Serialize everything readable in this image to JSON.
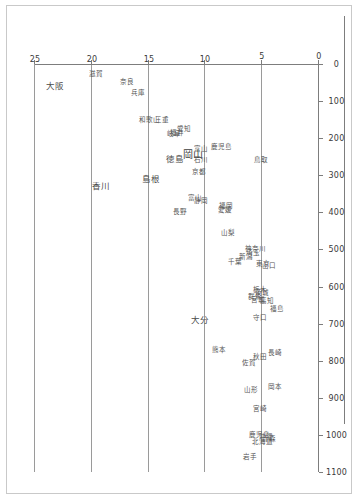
{
  "page": {
    "background_color": "#ffffff",
    "border_color": "#c9c9c9",
    "axis_color": "#7d7d7d",
    "grid_color": "#9a9a9a",
    "label_color": "#4a4a4a"
  },
  "chart_data": {
    "type": "scatter",
    "title": "",
    "subtitle": "",
    "xlabel": "",
    "ylabel": "",
    "orientation": "rotated-90-clockwise",
    "grid": true,
    "legend": "none",
    "xlim": [
      0,
      1100
    ],
    "ylim": [
      0,
      25
    ],
    "x_ticks": [
      0,
      100,
      200,
      300,
      400,
      500,
      600,
      700,
      800,
      900,
      1000,
      1100
    ],
    "x_tick_labels": [
      "0",
      "100",
      "200",
      "300",
      "400",
      "500",
      "600",
      "700",
      "800",
      "900",
      "1000",
      "1100"
    ],
    "y_ticks": [
      0,
      5,
      10,
      15,
      20,
      25
    ],
    "y_tick_labels": [
      "0",
      "5",
      "10",
      "15",
      "20",
      "25"
    ],
    "point_label_mode": "text-only",
    "points": [
      {
        "label": "大阪",
        "x": 60,
        "y": 23.2,
        "size": "mid"
      },
      {
        "label": "滋賀",
        "x": 28,
        "y": 19.6,
        "size": "sm"
      },
      {
        "label": "奈良",
        "x": 48,
        "y": 16.9,
        "size": "sm"
      },
      {
        "label": "兵庫",
        "x": 78,
        "y": 15.9,
        "size": "sm"
      },
      {
        "label": "三重",
        "x": 150,
        "y": 13.8,
        "size": "sm"
      },
      {
        "label": "和歌山",
        "x": 150,
        "y": 15.0,
        "size": "sm"
      },
      {
        "label": "愛知",
        "x": 175,
        "y": 11.9,
        "size": "sm"
      },
      {
        "label": "福井",
        "x": 185,
        "y": 12.5,
        "size": "sm"
      },
      {
        "label": "岐阜",
        "x": 190,
        "y": 12.8,
        "size": "sm"
      },
      {
        "label": "香川",
        "x": 330,
        "y": 19.2,
        "size": "mid"
      },
      {
        "label": "岡山",
        "x": 245,
        "y": 11.1,
        "size": "big"
      },
      {
        "label": "富山",
        "x": 228,
        "y": 10.4,
        "size": "sm"
      },
      {
        "label": "石川",
        "x": 258,
        "y": 10.4,
        "size": "sm"
      },
      {
        "label": "徳島",
        "x": 255,
        "y": 12.7,
        "size": "mid"
      },
      {
        "label": "島根",
        "x": 310,
        "y": 14.8,
        "size": "mid"
      },
      {
        "label": "京都",
        "x": 290,
        "y": 10.6,
        "size": "sm"
      },
      {
        "label": "鹿児島",
        "x": 225,
        "y": 8.6,
        "size": "sm"
      },
      {
        "label": "鳥取",
        "x": 260,
        "y": 5.1,
        "size": "sm"
      },
      {
        "label": "静岡",
        "x": 370,
        "y": 10.4,
        "size": "sm"
      },
      {
        "label": "富山",
        "x": 362,
        "y": 10.9,
        "size": "sm"
      },
      {
        "label": "福岡",
        "x": 383,
        "y": 8.2,
        "size": "sm"
      },
      {
        "label": "愛媛",
        "x": 393,
        "y": 8.3,
        "size": "sm"
      },
      {
        "label": "長野",
        "x": 400,
        "y": 12.2,
        "size": "sm"
      },
      {
        "label": "山梨",
        "x": 455,
        "y": 8.0,
        "size": "sm"
      },
      {
        "label": "神奈川",
        "x": 500,
        "y": 5.6,
        "size": "sm"
      },
      {
        "label": "埼玉",
        "x": 510,
        "y": 5.8,
        "size": "sm"
      },
      {
        "label": "新潟",
        "x": 520,
        "y": 6.4,
        "size": "sm"
      },
      {
        "label": "千葉",
        "x": 535,
        "y": 7.4,
        "size": "sm"
      },
      {
        "label": "東京",
        "x": 540,
        "y": 4.9,
        "size": "sm"
      },
      {
        "label": "山口",
        "x": 545,
        "y": 4.4,
        "size": "sm"
      },
      {
        "label": "栃木",
        "x": 610,
        "y": 5.2,
        "size": "sm"
      },
      {
        "label": "茨城",
        "x": 618,
        "y": 5.0,
        "size": "sm"
      },
      {
        "label": "群馬",
        "x": 628,
        "y": 5.6,
        "size": "sm"
      },
      {
        "label": "宮城",
        "x": 636,
        "y": 5.4,
        "size": "sm"
      },
      {
        "label": "高知",
        "x": 640,
        "y": 4.6,
        "size": "sm"
      },
      {
        "label": "福島",
        "x": 660,
        "y": 3.7,
        "size": "sm"
      },
      {
        "label": "守口",
        "x": 685,
        "y": 5.2,
        "size": "sm"
      },
      {
        "label": "大分",
        "x": 690,
        "y": 10.5,
        "size": "mid"
      },
      {
        "label": "熊本",
        "x": 770,
        "y": 8.8,
        "size": "sm"
      },
      {
        "label": "長崎",
        "x": 780,
        "y": 3.9,
        "size": "sm"
      },
      {
        "label": "秋田",
        "x": 790,
        "y": 5.2,
        "size": "sm"
      },
      {
        "label": "佐賀",
        "x": 805,
        "y": 6.2,
        "size": "sm"
      },
      {
        "label": "山形",
        "x": 880,
        "y": 6.0,
        "size": "sm"
      },
      {
        "label": "岡本",
        "x": 870,
        "y": 3.9,
        "size": "sm"
      },
      {
        "label": "宮崎",
        "x": 930,
        "y": 5.2,
        "size": "sm"
      },
      {
        "label": "鹿児島",
        "x": 1000,
        "y": 5.3,
        "size": "sm"
      },
      {
        "label": "沖縄",
        "x": 1005,
        "y": 4.7,
        "size": "sm"
      },
      {
        "label": "青森",
        "x": 1010,
        "y": 4.4,
        "size": "sm"
      },
      {
        "label": "北海道",
        "x": 1020,
        "y": 5.0,
        "size": "sm"
      },
      {
        "label": "岩手",
        "x": 1060,
        "y": 6.1,
        "size": "sm"
      }
    ]
  }
}
